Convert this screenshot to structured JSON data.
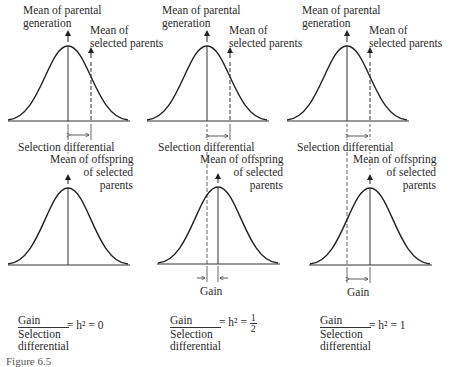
{
  "panels": [
    {
      "id": "h2-0",
      "top": {
        "parental_mean_label": [
          "Mean of parental",
          "generation"
        ],
        "selected_mean_label": [
          "Mean of",
          "selected parents"
        ],
        "differential_label": "Selection differential"
      },
      "bottom": {
        "offspring_mean_label": [
          "Mean of offspring",
          "of selected",
          "parents"
        ],
        "gain_label": ""
      },
      "formula": {
        "numerator": "Gain",
        "denominator": [
          "Selection",
          "differential"
        ],
        "equals": "= h² = 0"
      }
    },
    {
      "id": "h2-half",
      "top": {
        "parental_mean_label": [
          "Mean of parental",
          "generation"
        ],
        "selected_mean_label": [
          "Mean of",
          "selected parents"
        ],
        "differential_label": "Selection differential"
      },
      "bottom": {
        "offspring_mean_label": [
          "Mean of offspring",
          "of selected",
          "parents"
        ],
        "gain_label": "Gain"
      },
      "formula": {
        "numerator": "Gain",
        "denominator": [
          "Selection",
          "differential"
        ],
        "equals": "= h² =",
        "fraction_value": {
          "num": "1",
          "den": "2"
        }
      }
    },
    {
      "id": "h2-1",
      "top": {
        "parental_mean_label": [
          "Mean of parental",
          "generation"
        ],
        "selected_mean_label": [
          "Mean of",
          "selected parents"
        ],
        "differential_label": "Selection differential"
      },
      "bottom": {
        "offspring_mean_label": [
          "Mean of offspring",
          "of selected",
          "parents"
        ],
        "gain_label": "Gain"
      },
      "formula": {
        "numerator": "Gain",
        "denominator": [
          "Selection",
          "differential"
        ],
        "equals": "= h² = 1"
      }
    }
  ],
  "caption": "Figure 6.5"
}
